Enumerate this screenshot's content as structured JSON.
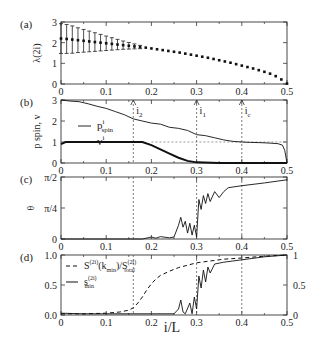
{
  "figure": {
    "panel_labels": [
      "(a)",
      "(b)",
      "(c)",
      "(d)"
    ],
    "xlabel": "i/L",
    "x_ticks": [
      "0",
      "0.1",
      "0.2",
      "0.3",
      "0.4",
      "0.5"
    ],
    "markers": [
      {
        "label": "i",
        "sub": "2",
        "x": 0.16
      },
      {
        "label": "i",
        "sub": "1",
        "x": 0.3
      },
      {
        "label": "i",
        "sub": "c",
        "x": 0.4
      }
    ]
  },
  "chart_data": [
    {
      "panel": "(a)",
      "type": "scatter",
      "ylabel": "λ^(2i)",
      "xlim": [
        0,
        0.5
      ],
      "ylim": [
        0,
        3
      ],
      "y_ticks": [
        "0",
        "1",
        "2",
        "3"
      ],
      "x": [
        0.0,
        0.0125,
        0.025,
        0.0375,
        0.05,
        0.0625,
        0.075,
        0.0875,
        0.1,
        0.1125,
        0.125,
        0.1375,
        0.15,
        0.1625,
        0.175,
        0.1875,
        0.2,
        0.2125,
        0.225,
        0.2375,
        0.25,
        0.2625,
        0.275,
        0.2875,
        0.3,
        0.3125,
        0.325,
        0.3375,
        0.35,
        0.3625,
        0.375,
        0.3875,
        0.4,
        0.4125,
        0.425,
        0.4375,
        0.45,
        0.4625,
        0.475,
        0.4875,
        0.5
      ],
      "values": [
        2.2,
        2.18,
        2.15,
        2.12,
        2.09,
        2.06,
        2.03,
        2.0,
        1.97,
        1.94,
        1.91,
        1.88,
        1.85,
        1.82,
        1.79,
        1.76,
        1.72,
        1.68,
        1.64,
        1.6,
        1.56,
        1.52,
        1.47,
        1.42,
        1.37,
        1.32,
        1.27,
        1.21,
        1.15,
        1.09,
        1.03,
        0.96,
        0.89,
        0.82,
        0.75,
        0.67,
        0.59,
        0.5,
        0.38,
        0.22,
        0.02
      ],
      "errors": [
        0.72,
        0.7,
        0.66,
        0.6,
        0.55,
        0.5,
        0.45,
        0.4,
        0.35,
        0.3,
        0.25,
        0.2,
        0.16,
        0.12,
        0.08,
        0.05,
        0.03,
        0.02,
        0.02,
        0.02,
        0.02,
        0.02,
        0.02,
        0.02,
        0.02,
        0.02,
        0.02,
        0.02,
        0.02,
        0.02,
        0.02,
        0.02,
        0.02,
        0.02,
        0.02,
        0.02,
        0.02,
        0.02,
        0.02,
        0.02,
        0.02
      ]
    },
    {
      "panel": "(b)",
      "type": "line",
      "ylabel": "p^i_spin, v^i",
      "xlim": [
        0,
        0.5
      ],
      "ylim": [
        0,
        3
      ],
      "y_ticks": [
        "0",
        "1",
        "2",
        "3"
      ],
      "legend": [
        "p^i_spin",
        "v^i"
      ],
      "series": [
        {
          "name": "p^i_spin",
          "style": "thin",
          "x": [
            0,
            0.02,
            0.04,
            0.06,
            0.08,
            0.1,
            0.12,
            0.14,
            0.16,
            0.18,
            0.2,
            0.22,
            0.24,
            0.26,
            0.28,
            0.3,
            0.32,
            0.34,
            0.36,
            0.38,
            0.4,
            0.42,
            0.44,
            0.46,
            0.48,
            0.49,
            0.495,
            0.5
          ],
          "values": [
            3.0,
            2.95,
            2.92,
            2.82,
            2.7,
            2.6,
            2.45,
            2.3,
            2.1,
            2.0,
            1.9,
            1.85,
            1.7,
            1.65,
            1.55,
            1.35,
            1.3,
            1.2,
            1.1,
            1.03,
            1.0,
            0.98,
            0.97,
            0.95,
            0.92,
            0.85,
            0.6,
            0.0
          ]
        },
        {
          "name": "v^i",
          "style": "thick",
          "x": [
            0,
            0.01,
            0.05,
            0.1,
            0.15,
            0.18,
            0.2,
            0.22,
            0.24,
            0.26,
            0.28,
            0.3,
            0.35,
            0.4,
            0.45,
            0.5
          ],
          "values": [
            0.9,
            1.0,
            1.0,
            1.0,
            1.0,
            1.0,
            0.85,
            0.65,
            0.45,
            0.25,
            0.1,
            0.03,
            0.0,
            0.0,
            0.0,
            0.0
          ]
        }
      ],
      "reference_line_y": 1.0
    },
    {
      "panel": "(c)",
      "type": "line",
      "ylabel": "θ^i",
      "xlim": [
        0,
        0.5
      ],
      "ylim": [
        0,
        1.5708
      ],
      "y_ticks": [
        "0",
        "π/4",
        "π/2"
      ],
      "series": [
        {
          "name": "θ^i",
          "x": [
            0,
            0.18,
            0.2,
            0.21,
            0.22,
            0.24,
            0.25,
            0.26,
            0.265,
            0.27,
            0.275,
            0.28,
            0.285,
            0.29,
            0.295,
            0.3,
            0.305,
            0.31,
            0.315,
            0.32,
            0.325,
            0.33,
            0.34,
            0.35,
            0.36,
            0.37,
            0.4,
            0.45,
            0.5
          ],
          "values": [
            0,
            0,
            0.05,
            0.02,
            0.06,
            0.03,
            0.05,
            0.35,
            0.55,
            0.3,
            0.45,
            0.15,
            0.4,
            0.1,
            0.35,
            0.05,
            1.0,
            0.75,
            1.1,
            0.9,
            1.15,
            0.95,
            1.2,
            1.05,
            1.2,
            1.3,
            1.35,
            1.42,
            1.5
          ]
        }
      ]
    },
    {
      "panel": "(d)",
      "type": "line",
      "ylabel": "",
      "xlim": [
        0,
        0.5
      ],
      "ylim": [
        0,
        1
      ],
      "y_ticks": [
        "0.0",
        "0.5",
        "1.0"
      ],
      "y2_ticks": [
        "0",
        "0.5",
        "1"
      ],
      "legend": [
        "S^(2i)(k_min)/S^(2i)_total",
        "s^(2i)_min"
      ],
      "series": [
        {
          "name": "S^(2i)(k_min)/S^(2i)_total",
          "style": "dashed",
          "x": [
            0,
            0.05,
            0.1,
            0.13,
            0.15,
            0.16,
            0.17,
            0.18,
            0.19,
            0.2,
            0.21,
            0.22,
            0.24,
            0.26,
            0.28,
            0.3,
            0.33,
            0.36,
            0.4,
            0.45,
            0.5
          ],
          "values": [
            0.02,
            0.02,
            0.03,
            0.05,
            0.08,
            0.12,
            0.2,
            0.3,
            0.42,
            0.52,
            0.6,
            0.66,
            0.73,
            0.79,
            0.83,
            0.87,
            0.9,
            0.93,
            0.95,
            0.98,
            1.0
          ]
        },
        {
          "name": "s^(2i)_min",
          "style": "solid",
          "x": [
            0,
            0.05,
            0.1,
            0.2,
            0.25,
            0.26,
            0.265,
            0.27,
            0.275,
            0.285,
            0.29,
            0.295,
            0.3,
            0.305,
            0.31,
            0.315,
            0.32,
            0.325,
            0.33,
            0.34,
            0.36,
            0.38,
            0.4,
            0.45,
            0.5
          ],
          "values": [
            0.03,
            0.02,
            0.02,
            0.02,
            0.02,
            0.1,
            0.25,
            0.05,
            0.02,
            0.2,
            0.02,
            0.3,
            0.1,
            0.65,
            0.45,
            0.75,
            0.55,
            0.8,
            0.7,
            0.85,
            0.88,
            0.9,
            0.92,
            0.97,
            1.0
          ]
        }
      ]
    }
  ]
}
